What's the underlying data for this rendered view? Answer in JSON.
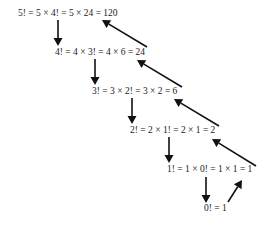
{
  "diagram": {
    "colors": {
      "text": "#222222",
      "arrow": "#111111",
      "background": "#ffffff"
    },
    "equations": [
      {
        "label": "5! = 5 × 4! = 5 × 24 = 120",
        "n": 5,
        "value": 120
      },
      {
        "label": "4! = 4 × 3! = 4 × 6 = 24",
        "n": 4,
        "value": 24
      },
      {
        "label": "3! = 3 × 2! = 3 × 2 = 6",
        "n": 3,
        "value": 6
      },
      {
        "label": "2! = 2 × 1! = 2 × 1 = 2",
        "n": 2,
        "value": 2
      },
      {
        "label": "1! = 1 × 0! = 1 × 1 = 1",
        "n": 1,
        "value": 1
      },
      {
        "label": "0! = 1",
        "n": 0,
        "value": 1
      }
    ],
    "down_arrows": [
      {
        "from": "5!",
        "to": "4!",
        "meaning": "recursive call"
      },
      {
        "from": "4!",
        "to": "3!",
        "meaning": "recursive call"
      },
      {
        "from": "3!",
        "to": "2!",
        "meaning": "recursive call"
      },
      {
        "from": "2!",
        "to": "1!",
        "meaning": "recursive call"
      },
      {
        "from": "1!",
        "to": "0!",
        "meaning": "recursive call"
      }
    ],
    "up_arrows": [
      {
        "from": "0!",
        "to": "1!",
        "returned": 1
      },
      {
        "from": "1!",
        "to": "2!",
        "returned": 1
      },
      {
        "from": "2!",
        "to": "3!",
        "returned": 2
      },
      {
        "from": "3!",
        "to": "4!",
        "returned": 6
      },
      {
        "from": "4!",
        "to": "5!",
        "returned": 24
      }
    ]
  }
}
